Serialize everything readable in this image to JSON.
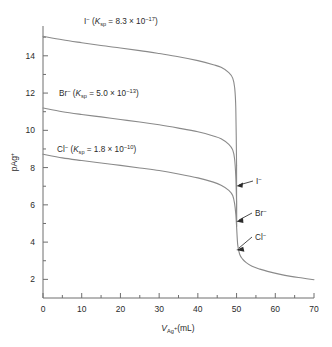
{
  "chart_data": {
    "type": "line",
    "title": "",
    "xlabel": "V_Ag+ (mL)",
    "ylabel": "pAg+",
    "xlim": [
      0,
      70
    ],
    "ylim": [
      1,
      15.6
    ],
    "grid": false,
    "legend_position": "inline-curve-labels",
    "x_ticks": [
      0,
      10,
      20,
      30,
      40,
      50,
      60,
      70
    ],
    "x_minor_ticks": [
      5,
      15,
      25,
      35,
      45,
      55,
      65
    ],
    "y_ticks": [
      2,
      4,
      6,
      8,
      10,
      12,
      14
    ],
    "y_minor_ticks": [
      3,
      5,
      7,
      9,
      11,
      13,
      15
    ],
    "equivalence_point_mL": 50,
    "series": [
      {
        "name": "I-",
        "label_text": "I⁻ (K_sp = 8.3 × 10⁻¹⁷)",
        "ksp_mantissa": "8.3",
        "ksp_exponent": "-17",
        "color": "#8a8a8a",
        "start_pAg": 15.05,
        "preequivalence_pAg_at_49": 13.4,
        "equivalence_pAg": 8.1,
        "x": [
          0,
          5,
          10,
          15,
          20,
          25,
          30,
          35,
          40,
          44,
          46,
          48,
          49,
          49.5,
          49.8,
          50
        ],
        "y": [
          15.05,
          14.86,
          14.7,
          14.55,
          14.42,
          14.28,
          14.12,
          13.95,
          13.74,
          13.52,
          13.38,
          13.1,
          12.8,
          12.3,
          11.2,
          8.1
        ]
      },
      {
        "name": "Br-",
        "label_text": "Br⁻ (K_sp = 5.0 × 10⁻¹³)",
        "ksp_mantissa": "5.0",
        "ksp_exponent": "-13",
        "color": "#8a8a8a",
        "start_pAg": 11.2,
        "preequivalence_pAg_at_49": 9.6,
        "equivalence_pAg": 6.15,
        "x": [
          0,
          5,
          10,
          15,
          20,
          25,
          30,
          35,
          40,
          44,
          46,
          48,
          49,
          49.5,
          49.8,
          50
        ],
        "y": [
          11.2,
          11.0,
          10.85,
          10.72,
          10.58,
          10.45,
          10.3,
          10.12,
          9.92,
          9.7,
          9.55,
          9.25,
          8.95,
          8.45,
          7.5,
          6.15
        ]
      },
      {
        "name": "Cl-",
        "label_text": "Cl⁻ (K_sp = 1.8 × 10⁻¹⁰)",
        "ksp_mantissa": "1.8",
        "ksp_exponent": "-10",
        "color": "#8a8a8a",
        "start_pAg": 8.72,
        "preequivalence_pAg_at_49": 7.1,
        "equivalence_pAg": 4.85,
        "x": [
          0,
          5,
          10,
          15,
          20,
          25,
          30,
          35,
          40,
          44,
          46,
          48,
          49,
          49.5,
          49.8,
          50
        ],
        "y": [
          8.72,
          8.52,
          8.38,
          8.25,
          8.12,
          7.98,
          7.84,
          7.66,
          7.45,
          7.22,
          7.05,
          6.78,
          6.5,
          6.05,
          5.5,
          4.85
        ]
      }
    ],
    "common_tail": {
      "description": "All three curves merge after the equivalence point",
      "color": "#8a8a8a",
      "x": [
        50,
        50.3,
        50.8,
        51.5,
        52.5,
        54,
        56,
        58,
        61,
        64,
        67,
        70
      ],
      "y": [
        4.85,
        3.85,
        3.35,
        3.1,
        2.9,
        2.7,
        2.55,
        2.43,
        2.28,
        2.16,
        2.07,
        1.98
      ]
    },
    "annotations": [
      {
        "name": "I-",
        "text": "I⁻",
        "target_x": 50,
        "target_y": 8.1
      },
      {
        "name": "Br-",
        "text": "Br⁻",
        "target_x": 50,
        "target_y": 6.15
      },
      {
        "name": "Cl-",
        "text": "Cl⁻",
        "target_x": 50,
        "target_y": 4.85
      }
    ]
  },
  "axes": {
    "x_title_main": "V",
    "x_title_sub": "Ag",
    "x_title_sup": "+",
    "x_title_tail": "(mL)",
    "y_title_main": "pAg",
    "y_title_sup": "+"
  },
  "labels": {
    "iodide": {
      "ion": "I",
      "charge": "−",
      "k": "K",
      "ksub": "sp",
      "eq": " = 8.3 × 10",
      "exp": "−17"
    },
    "bromide": {
      "ion": "Br",
      "charge": "−",
      "k": "K",
      "ksub": "sp",
      "eq": " = 5.0 × 10",
      "exp": "−13"
    },
    "chloride": {
      "ion": "Cl",
      "charge": "−",
      "k": "K",
      "ksub": "sp",
      "eq": " = 1.8 × 10",
      "exp": "−10"
    }
  },
  "annotation_labels": {
    "iodide": "I−",
    "bromide": "Br−",
    "chloride": "Cl−"
  },
  "ticks": {
    "x": [
      "0",
      "10",
      "20",
      "30",
      "40",
      "50",
      "60",
      "70"
    ],
    "y": [
      "2",
      "4",
      "6",
      "8",
      "10",
      "12",
      "14"
    ]
  },
  "style": {
    "curve_color": "#8a8a8a",
    "axis_color": "#6e6e6e",
    "text_color": "#2b2b2b",
    "background": "#ffffff"
  }
}
